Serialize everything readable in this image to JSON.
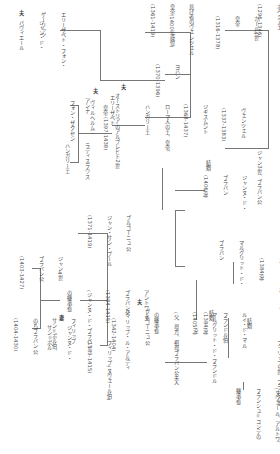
{
  "diagram": {
    "orientation": "rotated-90-clockwise",
    "lines_color": "#777777",
    "nodes": {
      "johann": {
        "lines": [
          "ヨハン",
          "ボヘミア王",
          "(1296-1346)"
        ]
      },
      "karl4": {
        "lines": [
          "カール4世",
          "皇帝",
          "(1316-1378)"
        ]
      },
      "wenzel_lux": {
        "lines": [
          "ヴェンツェル",
          "(1337-1383)"
        ]
      },
      "wenzel_lazy": {
        "lines": [
          "怠け者のヴェンツェル",
          "皇帝(1400年廃位)",
          "(1361-1419)"
        ]
      },
      "johann_gorlitz": {
        "lines": [
          "ヨハン",
          "(1370-1396)"
        ]
      },
      "sigismund": {
        "lines": [
          "ジギスムント",
          "(1368-1437)",
          "ローマ人の王、皇帝、",
          "ハンガリー王"
        ]
      },
      "elisabeth_gorlitz": {
        "lines": [
          "エリーザベト・フォン・",
          "ゲーリッツ"
        ],
        "spouse_mark": "夫",
        "spouse": [
          "ジャン・ド・",
          "バヴィエール"
        ]
      },
      "elisabeth_lux": {
        "lines": [
          "エリーザベト",
          "皇帝 (1397-1438)"
        ],
        "spouse_mark": "夫",
        "spouse": [
          "オーストリアのアルブレヒト2世"
        ]
      },
      "anna": {
        "lines": [
          "アンナ"
        ],
        "spouse_mark": "夫",
        "spouse": [
          "ヴィルヘルム・",
          "フォン・ザクセン"
        ]
      },
      "ladislaus": {
        "lines": [
          "ラディスラウス",
          "ハンガリー王"
        ]
      },
      "jean3": {
        "lines": [
          "ジャン3世、ブラバン公"
        ]
      },
      "jeanne": {
        "lines": [
          "ジャンヌ・ド・",
          "ブラバン",
          "(1406没)"
        ]
      },
      "marriage_1": {
        "label": "結婚"
      },
      "wenceslas": {
        "lines": [
          "ヴェンツェル"
        ]
      },
      "marguerite_brabant": {
        "lines": [
          "マルグリット・ド・",
          "ブラバン"
        ]
      },
      "louis_male": {
        "lines": [
          "ルイ・ド・フランドル",
          "ユー・ド・ヌヴェール",
          "(1384没)"
        ]
      },
      "louis_flandre": {
        "lines": [
          "ルイ・ド・マル",
          "フランドル伯",
          "(1384没)"
        ]
      },
      "marriage_2": {
        "label": "結婚"
      },
      "marriage_3": {
        "label": "結婚"
      },
      "philippe5": {
        "lines": [
          "フィリップ5世、フランス王"
        ]
      },
      "marguerite_artois": {
        "lines": [
          "マルグリット",
          "(ヌヴェール、アルトワ、",
          "フランシュ＝コンテの",
          "継承者)"
        ]
      },
      "marguerite_flandre": {
        "lines": [
          "マルグリット・ド・フランドル",
          "(1405没)",
          "(父、母方、祖母ブラバン公夫人",
          "の継承者)"
        ]
      },
      "philippe_hardi": {
        "lines": [
          "フィリップ(豪胆公)",
          "(1342-1404)"
        ],
        "spouse_mark": "夫",
        "spouse": [
          "ブルゴーニュ公",
          "フィリップ・ル・アルディ"
        ]
      },
      "antoine": {
        "lines": [
          "アントワーヌ",
          "ブラバン公",
          "(1384-1415)",
          "(ジャンヌ・ド・ブラバン",
          "の継承者)"
        ],
        "spouse_mark": "妻",
        "spouse": [
          "ジャンヌ・ド・",
          "サン＝ポル"
        ]
      },
      "jean_sans_peur": {
        "lines": [
          "ブルゴーニュ公",
          "ジャン・サン・プール",
          "(1371-1419)"
        ]
      },
      "philippe_burgundy": {
        "lines": [
          "フィリップ(ヌヴェール伯)",
          "(1389-1415)"
        ]
      },
      "jean4": {
        "lines": [
          "ジャン4世",
          "ブラバン公",
          "(1403-1427)"
        ]
      },
      "philippe_stpol": {
        "lines": [
          "フィリップ",
          "サン＝ポル伯、",
          "のちブラバン公",
          "(1404-1430)"
        ]
      }
    }
  }
}
